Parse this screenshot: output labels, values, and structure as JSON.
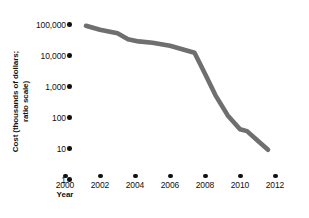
{
  "chart_data": {
    "type": "line",
    "title": "",
    "xlabel": "Year",
    "ylabel_lines": [
      "Cost (thousands of dollars;",
      "ratio scale)"
    ],
    "ylabel": "Cost (thousands of dollars; ratio scale)",
    "grid": false,
    "legend": "none",
    "line_color": "#6f6f6f",
    "tick_color": "#111111",
    "y_scale": "log",
    "ylim": [
      1,
      100000
    ],
    "y_ticks": [
      {
        "value": 100000,
        "label": "100,000"
      },
      {
        "value": 10000,
        "label": "10,000"
      },
      {
        "value": 1000,
        "label": "1,000"
      },
      {
        "value": 100,
        "label": "100"
      },
      {
        "value": 10,
        "label": "10"
      },
      {
        "value": 1,
        "label": "1"
      }
    ],
    "xlim": [
      2000,
      2012
    ],
    "x_ticks": [
      {
        "value": 2000,
        "label": "2000"
      },
      {
        "value": 2002,
        "label": "2002"
      },
      {
        "value": 2004,
        "label": "2004"
      },
      {
        "value": 2006,
        "label": "2006"
      },
      {
        "value": 2008,
        "label": "2008"
      },
      {
        "value": 2010,
        "label": "2010"
      },
      {
        "value": 2012,
        "label": "2012"
      }
    ],
    "series": [
      {
        "name": "Cost",
        "x": [
          2001.2,
          2002.0,
          2003.0,
          2003.6,
          2004.2,
          2005.0,
          2006.0,
          2007.0,
          2007.4,
          2008.0,
          2008.6,
          2009.3,
          2010.0,
          2010.4,
          2011.0,
          2011.6
        ],
        "values": [
          70000,
          52000,
          40000,
          26000,
          22000,
          20000,
          16000,
          11000,
          9500,
          2000,
          400,
          90,
          32,
          28,
          14,
          7
        ]
      }
    ]
  }
}
